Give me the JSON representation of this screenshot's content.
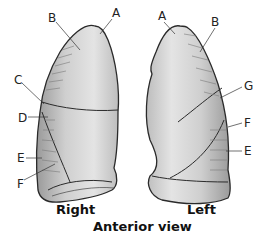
{
  "diagram": {
    "caption_right": "Right",
    "caption_left": "Left",
    "view_title": "Anterior view",
    "right_lung_labels": {
      "A": "A",
      "B": "B",
      "C": "C",
      "D": "D",
      "E": "E",
      "F": "F"
    },
    "left_lung_labels": {
      "A": "A",
      "B": "B",
      "G": "G",
      "F": "F",
      "E": "E"
    },
    "colors": {
      "outline": "#2a2a2a",
      "lung_fill": "#c9c9c9",
      "lung_highlight": "#e6e6e6",
      "shade": "#8a8a8a"
    }
  }
}
